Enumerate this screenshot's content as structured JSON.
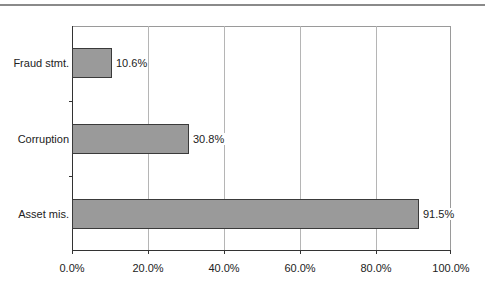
{
  "chart_data": {
    "type": "bar",
    "orientation": "horizontal",
    "title": "",
    "xlabel": "",
    "ylabel": "",
    "categories": [
      "Fraud stmt.",
      "Corruption",
      "Asset mis."
    ],
    "values": [
      10.6,
      30.8,
      91.5
    ],
    "value_labels": [
      "10.6%",
      "30.8%",
      "91.5%"
    ],
    "xlim": [
      0,
      100
    ],
    "x_ticks": [
      "0.0%",
      "20.0%",
      "40.0%",
      "60.0%",
      "80.0%",
      "100.0%"
    ],
    "grid": {
      "vertical": true,
      "horizontal": false
    },
    "legend": null,
    "colors": {
      "bar_fill": "#9a9a9a",
      "bar_border": "#3a3a3a",
      "grid": "#b5b5b5"
    }
  }
}
